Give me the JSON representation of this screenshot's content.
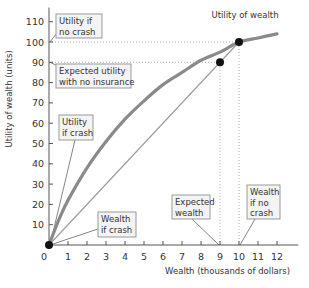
{
  "chart_data": {
    "type": "line",
    "title": "",
    "xlabel": "Wealth (thousands of dollars)",
    "ylabel": "Utility of wealth (units)",
    "xlim": [
      0,
      12.8
    ],
    "ylim": [
      0,
      115
    ],
    "x_ticks": [
      0,
      1,
      2,
      3,
      4,
      5,
      6,
      7,
      8,
      9,
      10,
      11,
      12
    ],
    "y_ticks": [
      10,
      20,
      30,
      40,
      50,
      60,
      70,
      80,
      90,
      100,
      110
    ],
    "grid": false,
    "series": [
      {
        "name": "Utility of wealth",
        "style": "thick-gray-curve",
        "x": [
          0,
          0.5,
          1,
          2,
          3,
          4,
          5,
          6,
          7,
          8,
          9,
          10,
          11,
          12
        ],
        "y": [
          0,
          12,
          22,
          38,
          51,
          62,
          71,
          79,
          85,
          91,
          95,
          100,
          102,
          104
        ]
      },
      {
        "name": "Chord (no insurance)",
        "style": "thin-gray-line",
        "x": [
          0,
          10
        ],
        "y": [
          0,
          100
        ]
      }
    ],
    "points": [
      {
        "label": "Utility of wealth (no crash)",
        "x": 10,
        "y": 100
      },
      {
        "label": "Expected utility with no insurance",
        "x": 9,
        "y": 90
      },
      {
        "label": "Wealth if crash / Utility if crash",
        "x": 0,
        "y": 0
      }
    ],
    "reference_lines": [
      {
        "type": "horizontal-dotted",
        "y": 100,
        "x_to": 10
      },
      {
        "type": "horizontal-dotted",
        "y": 90,
        "x_to": 9
      },
      {
        "type": "vertical-dotted",
        "x": 9,
        "y_to": 90
      },
      {
        "type": "vertical-dotted",
        "x": 10,
        "y_to": 100
      }
    ],
    "annotations": [
      {
        "id": "utility_no_crash",
        "lines": [
          "Utility if",
          "no crash"
        ],
        "points_to": {
          "x": 0,
          "y": 100
        }
      },
      {
        "id": "expected_utility",
        "lines": [
          "Expected utility",
          "with no insurance"
        ],
        "points_to": {
          "x": 0,
          "y": 90
        }
      },
      {
        "id": "utility_crash",
        "lines": [
          "Utility",
          "if crash"
        ],
        "points_to": {
          "x": 0,
          "y": 0
        }
      },
      {
        "id": "wealth_crash",
        "lines": [
          "Wealth",
          "if crash"
        ],
        "points_to": {
          "x": 0,
          "y": 0
        }
      },
      {
        "id": "expected_wealth",
        "lines": [
          "Expected",
          "wealth"
        ],
        "points_to": {
          "x": 9,
          "y": 0
        }
      },
      {
        "id": "wealth_no_crash",
        "lines": [
          "Wealth",
          "if no",
          "crash"
        ],
        "points_to": {
          "x": 10,
          "y": 0
        }
      },
      {
        "id": "curve_label",
        "lines": [
          "Utility of wealth"
        ],
        "points_to": {
          "x": 10,
          "y": 100
        }
      }
    ],
    "legend": null
  },
  "colors": {
    "curve": "#8a8a8a",
    "chord": "#9a9a9a",
    "axis": "#555555",
    "text": "#333333",
    "box_fill": "#f4f4f4",
    "box_stroke": "#999999",
    "dot": "#111111",
    "dotted": "#aaaaaa"
  }
}
